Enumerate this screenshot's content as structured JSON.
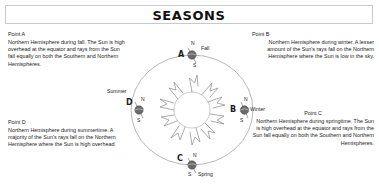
{
  "title": "SEASONS",
  "text_blocks": {
    "point_a": {
      "heading": "Point A",
      "body": "Northern Hemisphere during fall. The Sun is high overhead at the equator and rays from the Sun fall equally on both the Southern and Northern Hemispheres."
    },
    "point_b": {
      "heading": "Point B",
      "body": "Northern Hemisphere during winter. A lesser amount of the Sun's rays fall on the Northern Hemisphere where the Sun is low in the sky."
    },
    "point_c": {
      "heading": "Point C",
      "body": "Northern Hemisphere during springtime. The Sun is high overhead at the equator and rays from the Sun fall equally on both the Southern and Northern Hemispheres."
    },
    "point_d": {
      "heading": "Point D",
      "body": "Northern Hemisphere during summertime. A majority of the Sun's rays fall on the Northern Hemisphere where the Sun is high overhead."
    }
  },
  "diagram": {
    "sun_label": "sun",
    "orbit_label": "earth-orbit-ellipse",
    "positions": [
      {
        "id": "A",
        "point_letter": "A",
        "season": "Fall",
        "north_pole": "N",
        "south_pole": "S"
      },
      {
        "id": "B",
        "point_letter": "B",
        "season": "Winter",
        "north_pole": "N",
        "south_pole": "S"
      },
      {
        "id": "C",
        "point_letter": "C",
        "season": "Spring",
        "north_pole": "N",
        "south_pole": "S"
      },
      {
        "id": "D",
        "point_letter": "D",
        "season": "Summer",
        "north_pole": "N",
        "south_pole": "S"
      }
    ]
  },
  "colors": {
    "text": "#1c1c1c",
    "title": "#111111",
    "border": "#c9c9c9",
    "line": "#8a8a8a",
    "earth": "#555555"
  }
}
